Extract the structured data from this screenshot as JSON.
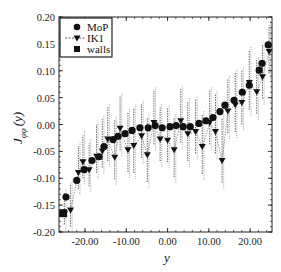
{
  "chart_data": {
    "type": "scatter",
    "title": "",
    "xlabel": "y",
    "ylabel": "J_φφ(y)",
    "ylabel_main": "J",
    "ylabel_sub": "φφ",
    "ylabel_arg": "(y)",
    "xlim": [
      -26.3,
      25.3
    ],
    "ylim": [
      -0.2,
      0.2
    ],
    "xticks": [
      -20,
      -10,
      0,
      10,
      20
    ],
    "xtick_labels": [
      "-20.00",
      "-10.00",
      "0.00",
      "10.00",
      "20.00"
    ],
    "yticks": [
      0.2,
      0.15,
      0.1,
      0.05,
      0.0,
      -0.05,
      -0.1,
      -0.15,
      -0.2
    ],
    "ytick_labels": [
      "0.20",
      "0.15",
      "0.10",
      "0.05",
      "0.00",
      "-0.05",
      "-0.10",
      "-0.15",
      "-0.20"
    ],
    "grid": false,
    "legend_position": "upper left",
    "legend": [
      {
        "label": "MoP",
        "marker": "circle",
        "line": "none"
      },
      {
        "label": "IK1",
        "marker": "triangle-down",
        "line": "dashed"
      },
      {
        "label": "walls",
        "marker": "square",
        "line": "none"
      }
    ],
    "series": [
      {
        "name": "MoP",
        "marker": "circle",
        "x": [
          -24.6,
          -22.0,
          -20.2,
          -18.3,
          -16.6,
          -15.4,
          -13.2,
          -12.0,
          -10.3,
          -8.6,
          -6.7,
          -4.7,
          -3.0,
          -1.3,
          0.6,
          2.1,
          3.8,
          5.5,
          7.6,
          9.3,
          11.0,
          12.7,
          13.9,
          16.1,
          18.1,
          19.8,
          22.2,
          22.9,
          24.4
        ],
        "y": [
          -0.135,
          -0.104,
          -0.084,
          -0.067,
          -0.06,
          -0.041,
          -0.028,
          -0.022,
          -0.017,
          -0.011,
          -0.006,
          -0.006,
          -0.002,
          -0.006,
          -0.004,
          -0.002,
          -0.004,
          -0.004,
          0.002,
          0.007,
          0.013,
          0.024,
          0.036,
          0.045,
          0.06,
          0.073,
          0.101,
          0.114,
          0.148
        ]
      },
      {
        "name": "IK1",
        "marker": "triangle-down",
        "line": "dashed",
        "x": [
          -25.0,
          -23.5,
          -21.6,
          -20.5,
          -19.0,
          -17.2,
          -15.8,
          -14.5,
          -12.8,
          -11.5,
          -9.6,
          -8.2,
          -6.3,
          -4.9,
          -3.3,
          -1.8,
          0.0,
          1.6,
          3.2,
          4.9,
          6.8,
          8.4,
          10.2,
          11.6,
          13.2,
          14.6,
          16.4,
          18.0,
          19.8,
          21.6,
          23.0,
          24.6
        ],
        "y": [
          -0.166,
          -0.16,
          -0.09,
          -0.07,
          -0.085,
          -0.06,
          -0.05,
          -0.028,
          -0.062,
          -0.008,
          -0.048,
          -0.04,
          -0.022,
          -0.057,
          0.003,
          -0.028,
          -0.03,
          -0.048,
          0.006,
          -0.018,
          -0.014,
          -0.042,
          0.003,
          -0.014,
          -0.068,
          0.024,
          0.036,
          0.04,
          0.077,
          0.06,
          0.088,
          0.135
        ],
        "error_low": [
          0.02,
          0.03,
          0.03,
          0.03,
          0.03,
          0.03,
          0.03,
          0.04,
          0.04,
          0.04,
          0.04,
          0.05,
          0.04,
          0.05,
          0.04,
          0.04,
          0.04,
          0.05,
          0.04,
          0.05,
          0.04,
          0.05,
          0.04,
          0.04,
          0.04,
          0.04,
          0.05,
          0.04,
          0.05,
          0.04,
          0.04,
          0.04
        ],
        "error_high": [
          0.04,
          0.05,
          0.05,
          0.05,
          0.05,
          0.06,
          0.06,
          0.06,
          0.07,
          0.06,
          0.07,
          0.07,
          0.06,
          0.07,
          0.06,
          0.06,
          0.06,
          0.06,
          0.06,
          0.06,
          0.06,
          0.06,
          0.06,
          0.07,
          0.08,
          0.06,
          0.06,
          0.06,
          0.06,
          0.06,
          0.06,
          0.05
        ]
      },
      {
        "name": "walls",
        "marker": "square",
        "x": [
          -25.3
        ],
        "y": [
          -0.165
        ]
      }
    ]
  }
}
